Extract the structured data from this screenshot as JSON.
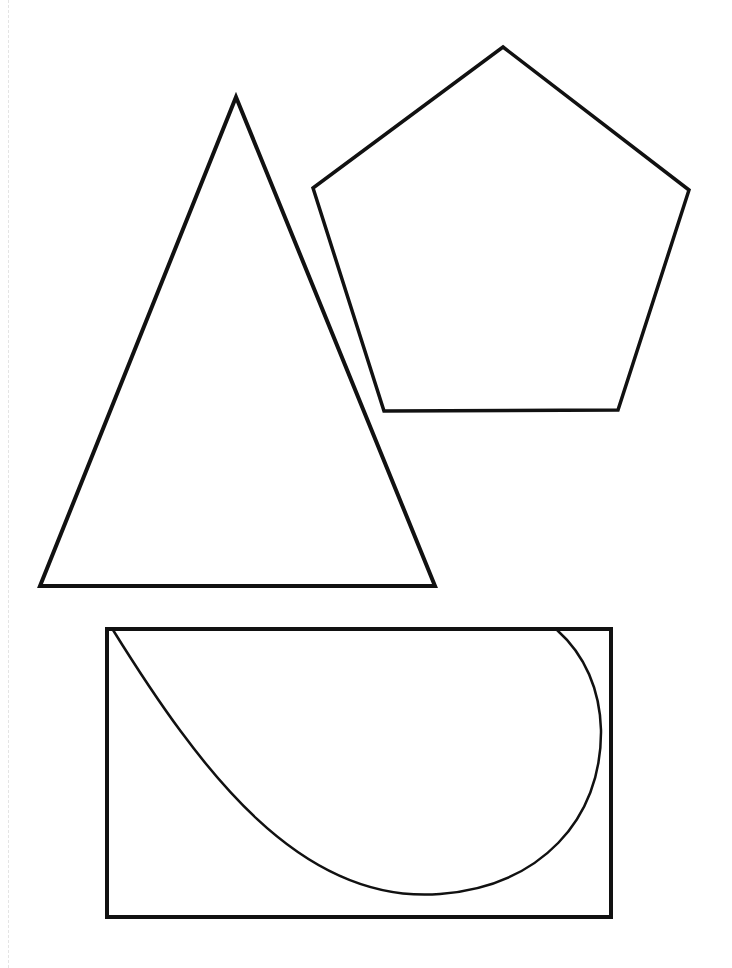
{
  "diagram": {
    "title": "",
    "stroke_color": "#111111",
    "background_color": "#ffffff",
    "shapes": [
      {
        "id": "triangle",
        "kind": "isosceles-triangle",
        "label": ""
      },
      {
        "id": "pentagon",
        "kind": "regular-pentagon",
        "label": ""
      },
      {
        "id": "rectangle",
        "kind": "rectangle",
        "label": ""
      },
      {
        "id": "curve",
        "kind": "curved-arc-inside-rectangle",
        "label": ""
      }
    ]
  }
}
